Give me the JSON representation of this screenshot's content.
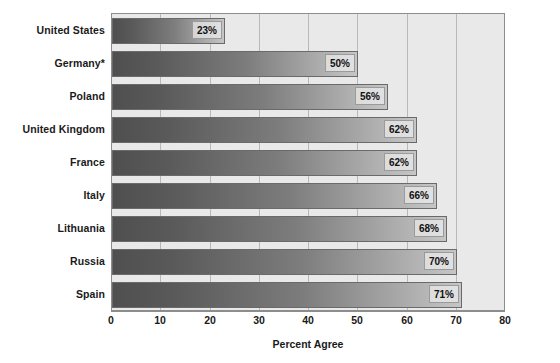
{
  "chart_data": {
    "type": "bar",
    "orientation": "horizontal",
    "title": "",
    "xlabel": "Percent Agree",
    "ylabel": "",
    "xlim": [
      0,
      80
    ],
    "xticks": [
      0,
      10,
      20,
      30,
      40,
      50,
      60,
      70,
      80
    ],
    "xtick_labels": [
      "0",
      "10",
      "20",
      "30",
      "40",
      "50",
      "60",
      "70",
      "80"
    ],
    "grid": true,
    "legend": false,
    "categories": [
      "United States",
      "Germany*",
      "Poland",
      "United Kingdom",
      "France",
      "Italy",
      "Lithuania",
      "Russia",
      "Spain"
    ],
    "values": [
      23,
      50,
      56,
      62,
      62,
      66,
      68,
      70,
      71
    ],
    "value_labels": [
      "23%",
      "50%",
      "56%",
      "62%",
      "62%",
      "66%",
      "68%",
      "70%",
      "71%"
    ],
    "colors": {
      "bar_gradient_start": "#4f4f4f",
      "bar_gradient_end": "#c6c6c6",
      "bar_border": "#6a6a6a",
      "plot_background": "#e9e9e9",
      "gridline": "#b9b9b9",
      "axis": "#8d8d8d",
      "text": "#1a1a1a",
      "value_label_background": "#ebebeb"
    }
  }
}
